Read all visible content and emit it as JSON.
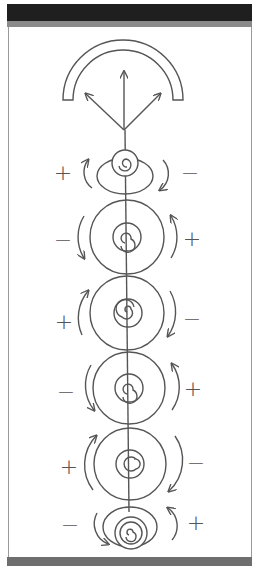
{
  "figure": {
    "colors": {
      "header": "#1f1f1f",
      "strip": "#8a8a8a",
      "stroke": "#555555",
      "background": "#ffffff"
    },
    "blocks": [
      {
        "left_sign": "+",
        "right_sign": "−",
        "left_arrow": "up",
        "right_arrow": "down"
      },
      {
        "left_sign": "−",
        "right_sign": "+",
        "left_arrow": "down",
        "right_arrow": "up"
      },
      {
        "left_sign": "+",
        "right_sign": "−",
        "left_arrow": "up",
        "right_arrow": "down"
      },
      {
        "left_sign": "−",
        "right_sign": "+",
        "left_arrow": "down",
        "right_arrow": "up"
      },
      {
        "left_sign": "+",
        "right_sign": "−",
        "left_arrow": "up",
        "right_arrow": "down"
      },
      {
        "left_sign": "−",
        "right_sign": "+",
        "left_arrow": "down",
        "right_arrow": "up"
      }
    ],
    "top_arrows": [
      "up",
      "up-left",
      "up-right"
    ],
    "icons": [
      "horseshoe-arc",
      "spiral-icon",
      "curved-arrow-icon"
    ]
  }
}
